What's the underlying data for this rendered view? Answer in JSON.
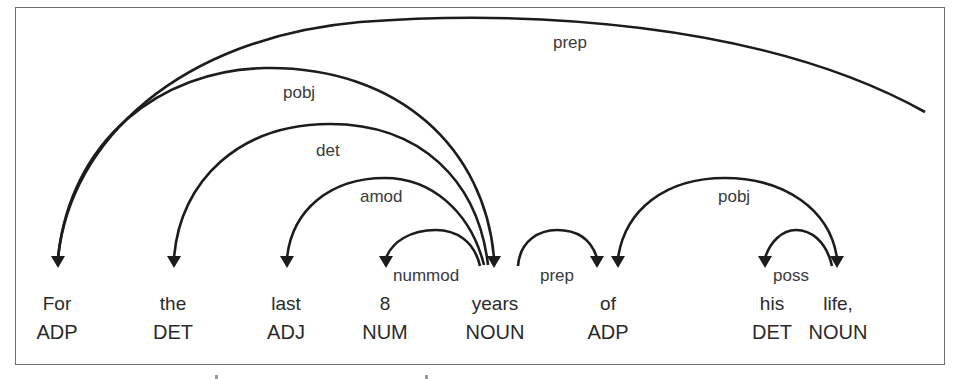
{
  "diagram": {
    "type": "dependency-parse",
    "tokens": [
      {
        "word": "For",
        "tag": "ADP",
        "x": 57
      },
      {
        "word": "the",
        "tag": "DET",
        "x": 173
      },
      {
        "word": "last",
        "tag": "ADJ",
        "x": 286
      },
      {
        "word": "8",
        "tag": "NUM",
        "x": 385
      },
      {
        "word": "years",
        "tag": "NOUN",
        "x": 495
      },
      {
        "word": "of",
        "tag": "ADP",
        "x": 608
      },
      {
        "word": "his",
        "tag": "DET",
        "x": 772
      },
      {
        "word": "life,",
        "tag": "NOUN",
        "x": 838
      }
    ],
    "arcs": [
      {
        "label": "prep",
        "head": "(off-screen right)",
        "dependent": "For"
      },
      {
        "label": "pobj",
        "head": "For",
        "dependent": "years"
      },
      {
        "label": "det",
        "head": "years",
        "dependent": "the"
      },
      {
        "label": "amod",
        "head": "years",
        "dependent": "last"
      },
      {
        "label": "nummod",
        "head": "years",
        "dependent": "8"
      },
      {
        "label": "prep",
        "head": "years",
        "dependent": "of"
      },
      {
        "label": "pobj",
        "head": "of",
        "dependent": "life,"
      },
      {
        "label": "poss",
        "head": "life,",
        "dependent": "his"
      }
    ],
    "colors": {
      "line": "#1c1c1c",
      "text": "#2a2a2a",
      "frame": "#6e6e6e",
      "background": "#ffffff"
    }
  }
}
